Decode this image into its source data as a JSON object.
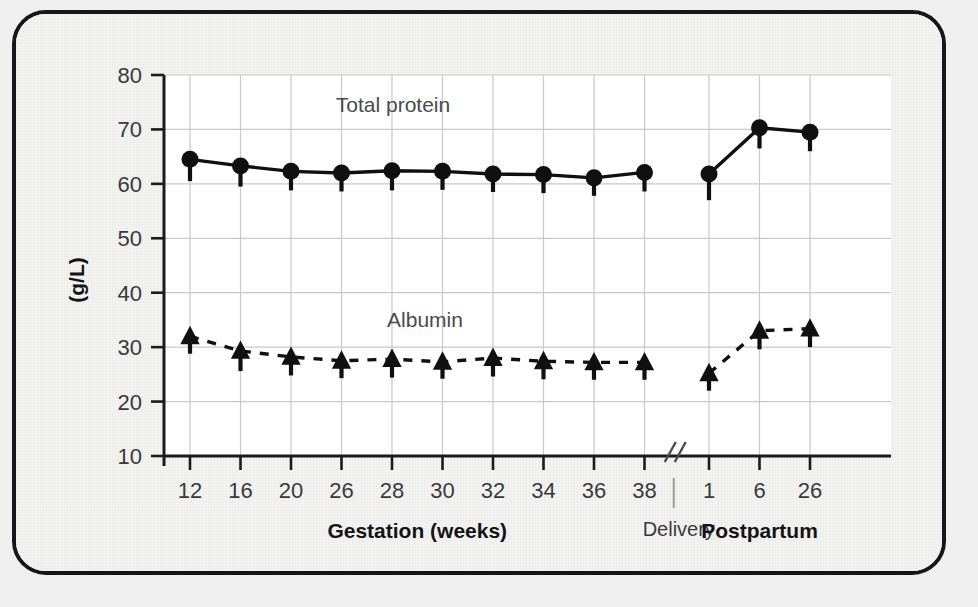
{
  "figure": {
    "frame_border_color": "#16161a",
    "background_color": "#f0efed",
    "plot_background_color": "#ffffff",
    "grid_color": "#c9c9c9",
    "series_color": "#101013"
  },
  "chart_data": {
    "type": "line",
    "title": "",
    "subtitle": "",
    "xlabel": "Gestation (weeks)",
    "ylabel": "(g/L)",
    "ylim": [
      10,
      80
    ],
    "yticks": [
      10,
      20,
      30,
      40,
      50,
      60,
      70,
      80
    ],
    "ytick_labels": [
      "10",
      "20",
      "30",
      "40",
      "50",
      "60",
      "70",
      "80"
    ],
    "grid": true,
    "legend_position": "inline-annotations",
    "axis_break": {
      "present": true,
      "symbol": "//",
      "label": "Delivery",
      "label_bold": false
    },
    "x_sections": [
      {
        "name": "Gestation (weeks)",
        "bold": true,
        "categories": [
          "12",
          "16",
          "20",
          "26",
          "28",
          "30",
          "32",
          "34",
          "36",
          "38"
        ]
      },
      {
        "name": "Postpartum",
        "bold": true,
        "categories": [
          "1",
          "6",
          "26"
        ]
      }
    ],
    "x": [
      "12",
      "16",
      "20",
      "26",
      "28",
      "30",
      "32",
      "34",
      "36",
      "38",
      "1",
      "6",
      "26"
    ],
    "series": [
      {
        "name": "Total protein",
        "marker": "circle",
        "linestyle": "solid",
        "errorbar": "lower",
        "values": [
          64.5,
          63.3,
          62.3,
          62.0,
          62.4,
          62.3,
          61.8,
          61.7,
          61.1,
          62.1,
          61.8,
          70.3,
          69.5
        ],
        "error_low": [
          60.5,
          59.5,
          58.8,
          58.6,
          58.8,
          58.9,
          58.5,
          58.3,
          57.8,
          58.6,
          57.0,
          66.5,
          66.0
        ]
      },
      {
        "name": "Albumin",
        "marker": "triangle",
        "linestyle": "dashed",
        "errorbar": "lower",
        "values": [
          32.0,
          29.3,
          28.2,
          27.5,
          27.8,
          27.3,
          28.0,
          27.4,
          27.2,
          27.2,
          25.2,
          33.0,
          33.4
        ],
        "error_low": [
          28.8,
          25.6,
          24.8,
          24.3,
          24.4,
          24.2,
          24.6,
          24.1,
          24.0,
          24.0,
          22.0,
          29.6,
          30.0
        ]
      }
    ],
    "annotations": [
      {
        "text": "Total protein",
        "series": "Total protein"
      },
      {
        "text": "Albumin",
        "series": "Albumin"
      }
    ]
  }
}
